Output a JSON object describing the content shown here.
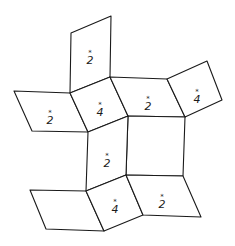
{
  "diagram": {
    "type": "net-of-quadrilateral-faces",
    "stroke_color": "#1a1a1a",
    "background": "#ffffff",
    "faces": [
      {
        "id": "top",
        "points": "71,33 111,16 110,77 70,93",
        "label": "2",
        "mark": "*",
        "lx": 90,
        "ly": 64
      },
      {
        "id": "upper-left",
        "points": "14,91 70,93 88,132 32,131",
        "label": "2",
        "mark": "*",
        "lx": 50,
        "ly": 124
      },
      {
        "id": "upper-center",
        "points": "70,93 110,77 128,116 88,132",
        "label": "4",
        "mark": "*",
        "lx": 100,
        "ly": 116
      },
      {
        "id": "upper-middle",
        "points": "110,77 167,79 185,117 128,116",
        "label": "2",
        "mark": "*",
        "lx": 148,
        "ly": 110
      },
      {
        "id": "upper-right",
        "points": "167,79 207,61 222,100 185,117",
        "label": "4",
        "mark": "*",
        "lx": 197,
        "ly": 103
      },
      {
        "id": "center-square",
        "points": "128,116 185,117 183,176 126,175",
        "label": "",
        "mark": "",
        "lx": 0,
        "ly": 0
      },
      {
        "id": "center-left",
        "points": "88,132 128,116 126,175 86,191",
        "label": "2",
        "mark": "*",
        "lx": 107,
        "ly": 167
      },
      {
        "id": "lower-left",
        "points": "30,190 86,191 104,231 46,229",
        "label": "",
        "mark": "",
        "lx": 0,
        "ly": 0
      },
      {
        "id": "lower-center",
        "points": "86,191 126,175 143,215 104,231",
        "label": "4",
        "mark": "*",
        "lx": 115,
        "ly": 213
      },
      {
        "id": "lower-right",
        "points": "126,175 183,176 201,217 143,215",
        "label": "2",
        "mark": "*",
        "lx": 162,
        "ly": 208
      }
    ]
  }
}
